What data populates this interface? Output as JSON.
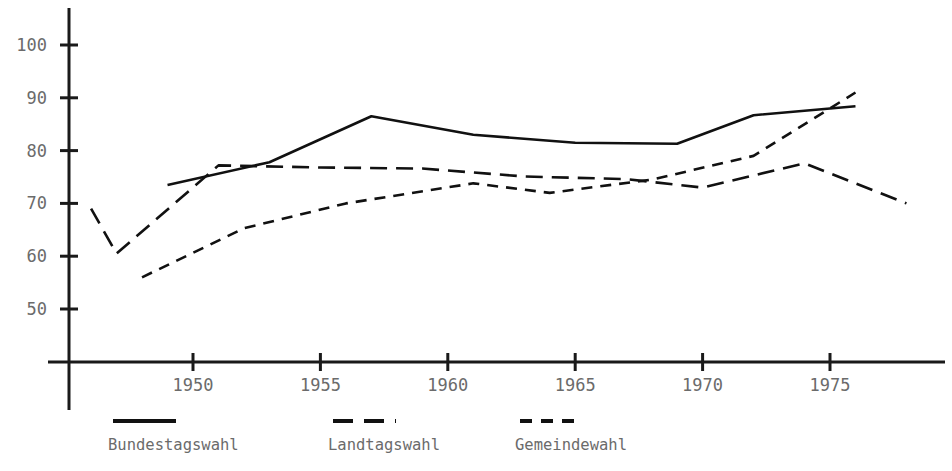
{
  "chart_data": {
    "type": "line",
    "title": "",
    "subtitle": "",
    "xlabel": "",
    "ylabel": "",
    "xlim": [
      1945,
      1979
    ],
    "ylim": [
      44,
      105
    ],
    "grid": false,
    "legend_position": "bottom",
    "x_ticks": [
      1950,
      1955,
      1960,
      1965,
      1970,
      1975
    ],
    "x_tick_labels": [
      "1950",
      "1955",
      "1960",
      "1965",
      "1970",
      "1975"
    ],
    "y_ticks": [
      50,
      60,
      70,
      80,
      90,
      100
    ],
    "y_tick_labels": [
      "50",
      "60",
      "70",
      "80",
      "90",
      "100"
    ],
    "series": [
      {
        "name": "Bundestagswahl",
        "style": "solid",
        "dash": "none",
        "color": "#111111",
        "points": [
          {
            "x": 1949,
            "y": 73.5
          },
          {
            "x": 1953,
            "y": 77.8
          },
          {
            "x": 1957,
            "y": 86.5
          },
          {
            "x": 1961,
            "y": 83.0
          },
          {
            "x": 1965,
            "y": 81.5
          },
          {
            "x": 1969,
            "y": 81.3
          },
          {
            "x": 1972,
            "y": 86.7
          },
          {
            "x": 1976,
            "y": 88.4
          }
        ]
      },
      {
        "name": "Landtagswahl",
        "style": "long-dash",
        "dash": "17,9",
        "color": "#111111",
        "points": [
          {
            "x": 1946,
            "y": 69.0
          },
          {
            "x": 1947,
            "y": 60.5
          },
          {
            "x": 1951,
            "y": 77.2
          },
          {
            "x": 1955,
            "y": 76.8
          },
          {
            "x": 1959,
            "y": 76.6
          },
          {
            "x": 1963,
            "y": 75.1
          },
          {
            "x": 1967,
            "y": 74.6
          },
          {
            "x": 1970,
            "y": 73.0
          },
          {
            "x": 1974,
            "y": 77.6
          },
          {
            "x": 1978,
            "y": 70.0
          }
        ]
      },
      {
        "name": "Gemeindewahl",
        "style": "short-dash",
        "dash": "11,8",
        "color": "#111111",
        "points": [
          {
            "x": 1948,
            "y": 56.0
          },
          {
            "x": 1952,
            "y": 65.3
          },
          {
            "x": 1956,
            "y": 70.0
          },
          {
            "x": 1961,
            "y": 73.8
          },
          {
            "x": 1964,
            "y": 72.0
          },
          {
            "x": 1968,
            "y": 74.5
          },
          {
            "x": 1972,
            "y": 79.0
          },
          {
            "x": 1976,
            "y": 91.0
          }
        ]
      }
    ],
    "legend": [
      {
        "label": "Bundestagswahl",
        "style": "solid",
        "dash": "none"
      },
      {
        "label": "Landtagswahl",
        "style": "long-dash",
        "dash": "20,11"
      },
      {
        "label": "Gemeindewahl",
        "style": "short-dash",
        "dash": "12,9"
      }
    ]
  },
  "colors": {
    "ink": "#111111",
    "axis": "#1a1a1a",
    "label": "#6b6b6b",
    "background": "#ffffff"
  }
}
